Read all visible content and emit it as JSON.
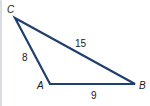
{
  "diagram": {
    "type": "triangle",
    "stroke_color": "#1f3f6e",
    "vertices": [
      {
        "name": "C",
        "label": "C"
      },
      {
        "name": "A",
        "label": "A"
      },
      {
        "name": "B",
        "label": "B"
      }
    ],
    "sides": [
      {
        "between": "C-A",
        "label": "8"
      },
      {
        "between": "C-B",
        "label": "15"
      },
      {
        "between": "A-B",
        "label": "9"
      }
    ]
  }
}
